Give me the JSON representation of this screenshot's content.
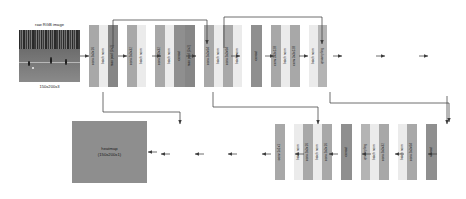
{
  "figure": {
    "type": "neural-network-architecture"
  },
  "input": {
    "title": "raw RGB image",
    "shape": "150x200x3"
  },
  "output": {
    "label_line1": "heatmap",
    "label_line2": "(150x200x1)"
  },
  "encoder": [
    {
      "name": "conv-3x3x16",
      "label": "conv 3x3x16",
      "kind": "conv"
    },
    {
      "name": "batch-norm-1",
      "label": "batch norm",
      "kind": "bn"
    },
    {
      "name": "max-pool-1",
      "label": "max pool (2x2)",
      "kind": "pool"
    },
    {
      "name": "conv-3x3x32-a",
      "label": "conv 3x3x32",
      "kind": "conv"
    },
    {
      "name": "batch-norm-2",
      "label": "batch norm",
      "kind": "bn"
    },
    {
      "name": "conv-3x3x32-b",
      "label": "conv 3x3x32",
      "kind": "conv"
    },
    {
      "name": "batch-norm-3",
      "label": "batch norm",
      "kind": "bn"
    },
    {
      "name": "concat-1",
      "label": "concat",
      "kind": "concat"
    },
    {
      "name": "max-pool-2",
      "label": "max pool (2x2)",
      "kind": "pool"
    },
    {
      "name": "conv-3x3x64-a",
      "label": "conv 3x3x64",
      "kind": "conv"
    },
    {
      "name": "batch-norm-4",
      "label": "batch norm",
      "kind": "bn"
    },
    {
      "name": "conv-3x3x64-b",
      "label": "conv 3x3x64",
      "kind": "conv"
    },
    {
      "name": "batch-norm-5",
      "label": "batch norm",
      "kind": "bn"
    },
    {
      "name": "concat-2",
      "label": "concat",
      "kind": "concat"
    },
    {
      "name": "conv-3x3x128-a",
      "label": "conv 3x3x128",
      "kind": "conv"
    },
    {
      "name": "batch-norm-6",
      "label": "batch norm",
      "kind": "bn"
    },
    {
      "name": "conv-3x3x128-b",
      "label": "conv 3x3x128",
      "kind": "conv"
    },
    {
      "name": "batch-norm-7",
      "label": "batch norm",
      "kind": "bn"
    },
    {
      "name": "upsampling-1",
      "label": "upsampling",
      "kind": "upsample"
    }
  ],
  "decoder": [
    {
      "name": "concat-3",
      "label": "concat",
      "kind": "concat"
    },
    {
      "name": "conv-3x3x64-c",
      "label": "conv 3x3x64",
      "kind": "conv"
    },
    {
      "name": "batch-norm-8",
      "label": "batch norm",
      "kind": "bn"
    },
    {
      "name": "conv-3x3x32-c",
      "label": "conv 3x3x32",
      "kind": "conv"
    },
    {
      "name": "batch-norm-9",
      "label": "batch norm",
      "kind": "bn"
    },
    {
      "name": "upsampling-2",
      "label": "upsampling",
      "kind": "upsample"
    },
    {
      "name": "concat-4",
      "label": "concat",
      "kind": "concat"
    },
    {
      "name": "conv-3x3x16-b",
      "label": "conv 3x3x16",
      "kind": "conv"
    },
    {
      "name": "batch-norm-10",
      "label": "batch norm",
      "kind": "bn"
    },
    {
      "name": "conv-3x3x16-c",
      "label": "conv 3x3x16",
      "kind": "conv"
    },
    {
      "name": "batch-norm-11",
      "label": "batch norm",
      "kind": "bn"
    },
    {
      "name": "conv-1x1x1",
      "label": "conv 1x1x1",
      "kind": "conv"
    }
  ],
  "colors": {
    "conv": "#a8a8a8",
    "batch_norm": "#ebebeb",
    "pool": "#868686",
    "concat": "#8f8f8f",
    "upsample": "#b4b4b4",
    "wire": "#3d3d3d",
    "background": "#ffffff"
  }
}
